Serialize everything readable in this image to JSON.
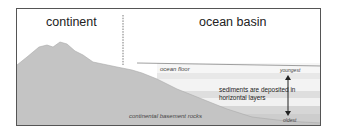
{
  "diagram": {
    "regions": {
      "continent": "continent",
      "ocean_basin": "ocean basin"
    },
    "labels": {
      "ocean_floor": "ocean floor",
      "basement": "continental basement rocks",
      "sediments_line1": "sediments are deposited in",
      "sediments_line2": "horizontal layers",
      "youngest": "youngest",
      "oldest": "oldest"
    },
    "colors": {
      "rock": "#c8c8c8",
      "sediment_light": "#eeeeee",
      "sediment_mid": "#dcdcdc",
      "sediment_dark": "#cfcfcf",
      "frame": "#555555",
      "divider": "#555555"
    }
  }
}
